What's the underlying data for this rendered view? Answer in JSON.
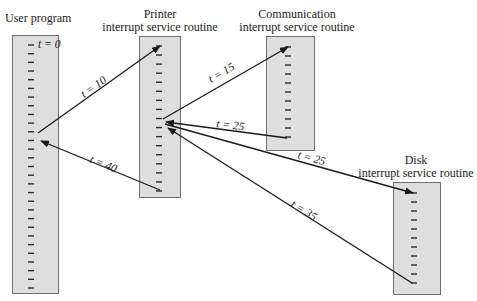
{
  "diagram": {
    "routines": [
      {
        "id": "user",
        "title_lines": [
          "User program"
        ],
        "ticks": 29
      },
      {
        "id": "printer",
        "title_lines": [
          "Printer",
          "interrupt service routine"
        ],
        "ticks": 17
      },
      {
        "id": "comm",
        "title_lines": [
          "Communication",
          "interrupt service routine"
        ],
        "ticks": 11
      },
      {
        "id": "disk",
        "title_lines": [
          "Disk",
          "interrupt service routine"
        ],
        "ticks": 11
      }
    ],
    "start_label": "t = 0",
    "transfers": [
      {
        "from": "user",
        "to": "printer",
        "label": "t = 10"
      },
      {
        "from": "printer",
        "to": "comm",
        "label": "t = 15"
      },
      {
        "from": "comm",
        "to": "printer",
        "label": "t = 25"
      },
      {
        "from": "printer",
        "to": "disk",
        "label": "t = 25"
      },
      {
        "from": "disk",
        "to": "printer",
        "label": "t = 35"
      },
      {
        "from": "printer",
        "to": "user",
        "label": "t = 40"
      }
    ]
  }
}
